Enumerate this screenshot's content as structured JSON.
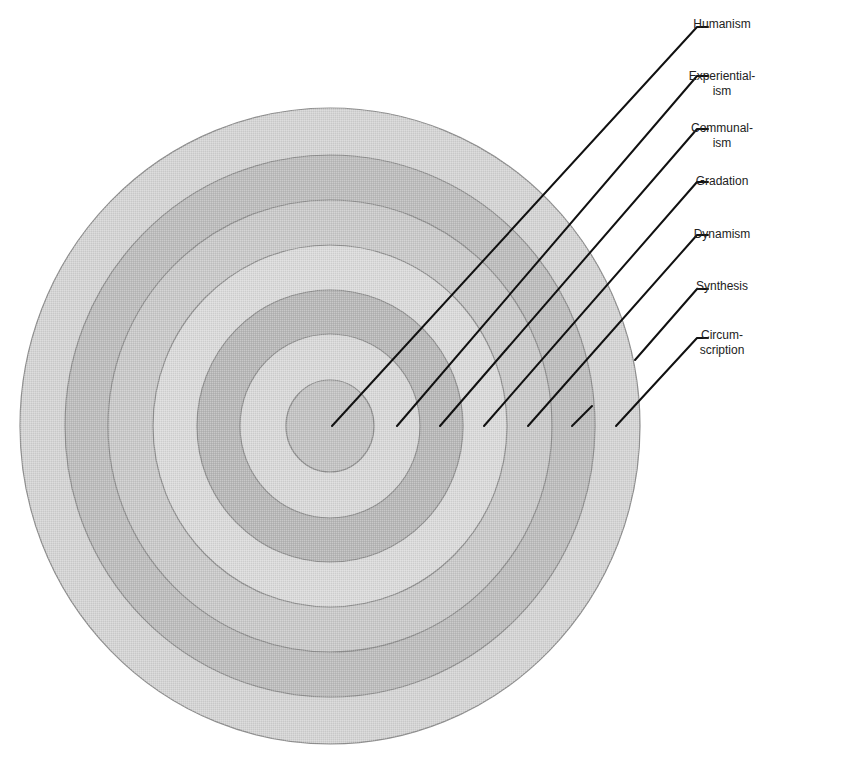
{
  "diagram": {
    "type": "concentric-circles",
    "center": [
      330,
      426
    ],
    "colors": {
      "background": "#ffffff",
      "ring_dark": "#b9b9b9",
      "ring_light": "#d6d6d6",
      "ring_border": "#8f8f8f",
      "leader_line": "#111111",
      "label_text": "#222222"
    },
    "rings": [
      {
        "index": 7,
        "label": "Circumscription",
        "rx": 310,
        "ry": 318,
        "fill": "#d4d4d4"
      },
      {
        "index": 6,
        "label": "Synthesis",
        "rx": 265,
        "ry": 271,
        "fill": "#bdbdbd"
      },
      {
        "index": 5,
        "label": "Dynamism",
        "rx": 222,
        "ry": 226,
        "fill": "#c9c9c9"
      },
      {
        "index": 4,
        "label": "Gradation",
        "rx": 177,
        "ry": 181,
        "fill": "#dadada"
      },
      {
        "index": 3,
        "label": "Communalism",
        "rx": 133,
        "ry": 136,
        "fill": "#b8b8b8"
      },
      {
        "index": 2,
        "label": "Experientialism",
        "rx": 90,
        "ry": 92,
        "fill": "#d8d8d8"
      },
      {
        "index": 1,
        "label": "Humanism",
        "rx": 44,
        "ry": 46,
        "fill": "#c3c3c3"
      }
    ],
    "labels": [
      {
        "lines": [
          "Humanism"
        ],
        "x": 722,
        "y": 17,
        "leader": {
          "from": [
            332,
            426
          ],
          "elbow": [
            697,
            27
          ],
          "to": [
            708,
            27
          ]
        }
      },
      {
        "lines": [
          "Experiential-",
          "ism"
        ],
        "x": 722,
        "y": 70,
        "leader": {
          "from": [
            397,
            426
          ],
          "elbow": [
            697,
            76
          ],
          "to": [
            708,
            76
          ]
        }
      },
      {
        "lines": [
          "Communal-",
          "ism"
        ],
        "x": 722,
        "y": 123,
        "leader": {
          "from": [
            440,
            426
          ],
          "elbow": [
            697,
            129
          ],
          "to": [
            708,
            129
          ]
        }
      },
      {
        "lines": [
          "Gradation"
        ],
        "x": 722,
        "y": 175,
        "leader": {
          "from": [
            484,
            426
          ],
          "elbow": [
            697,
            182
          ],
          "to": [
            708,
            182
          ]
        }
      },
      {
        "lines": [
          "Dynamism"
        ],
        "x": 722,
        "y": 228,
        "leader": {
          "from": [
            528,
            426
          ],
          "elbow": [
            697,
            235
          ],
          "to": [
            708,
            235
          ]
        }
      },
      {
        "lines": [
          "Synthesis"
        ],
        "x": 722,
        "y": 280,
        "leader": {
          "from": [
            572,
            426
          ],
          "elbow": [
            697,
            289
          ],
          "to": [
            708,
            289
          ],
          "gap_segment": {
            "from": [
              572,
              426
            ],
            "to": [
              592,
              406
            ]
          }
        }
      },
      {
        "lines": [
          "Circum-",
          "scription"
        ],
        "x": 722,
        "y": 330,
        "leader": {
          "from": [
            616,
            426
          ],
          "elbow": [
            697,
            338
          ],
          "to": [
            708,
            338
          ]
        }
      }
    ]
  },
  "chart_data": {
    "type": "concentric-layers",
    "title": "",
    "layers_inner_to_outer": [
      "Humanism",
      "Experientialism",
      "Communalism",
      "Gradation",
      "Dynamism",
      "Synthesis",
      "Circumscription"
    ],
    "legend_position": "right",
    "grid": false
  }
}
